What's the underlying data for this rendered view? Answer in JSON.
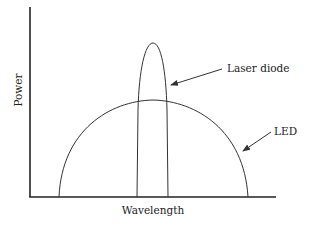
{
  "diagram": {
    "type": "spectral-comparison",
    "x_axis_label": "Wavelength",
    "y_axis_label": "Power",
    "curves": [
      {
        "name": "Laser diode",
        "shape": "narrow tall peak"
      },
      {
        "name": "LED",
        "shape": "broad semicircular dome"
      }
    ],
    "annotations": {
      "laser": "Laser diode",
      "led": "LED"
    }
  },
  "colors": {
    "line": "#333333",
    "background": "#ffffff"
  }
}
